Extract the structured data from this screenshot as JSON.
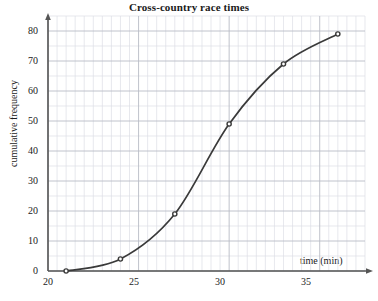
{
  "chart_data": {
    "type": "line",
    "title": "Cross-country race times",
    "xlabel": "time (min)",
    "ylabel": "cumulative frequency",
    "xlim": [
      20,
      37.5
    ],
    "ylim": [
      0,
      85
    ],
    "xticks": [
      20,
      25,
      30,
      35
    ],
    "yticks": [
      0,
      10,
      20,
      30,
      40,
      50,
      60,
      70,
      80
    ],
    "x_minor_step": 0.5,
    "y_minor_step": 5,
    "grid": true,
    "legend": "none",
    "marker": "circle",
    "x": [
      21,
      24,
      27,
      30,
      33,
      36
    ],
    "values": [
      0,
      4,
      19,
      49,
      69,
      79
    ],
    "points": [
      {
        "x": 21,
        "y": 0
      },
      {
        "x": 24,
        "y": 4
      },
      {
        "x": 27,
        "y": 19
      },
      {
        "x": 30,
        "y": 49
      },
      {
        "x": 33,
        "y": 69
      },
      {
        "x": 36,
        "y": 79
      }
    ]
  },
  "axes": {
    "y_tick_labels": [
      "0",
      "10",
      "20",
      "30",
      "40",
      "50",
      "60",
      "70",
      "80"
    ],
    "x_tick_labels": [
      "20",
      "25",
      "30",
      "35"
    ],
    "x_axis_title": "time (min)",
    "y_axis_title": "cumulative frequency"
  },
  "title": "Cross-country race times",
  "colors": {
    "curve": "#3a3a3a",
    "axis": "#555555",
    "grid_major": "#b9bcc6",
    "grid_minor": "#dcdee5",
    "text": "#1a1a1a",
    "background": "#ffffff"
  }
}
